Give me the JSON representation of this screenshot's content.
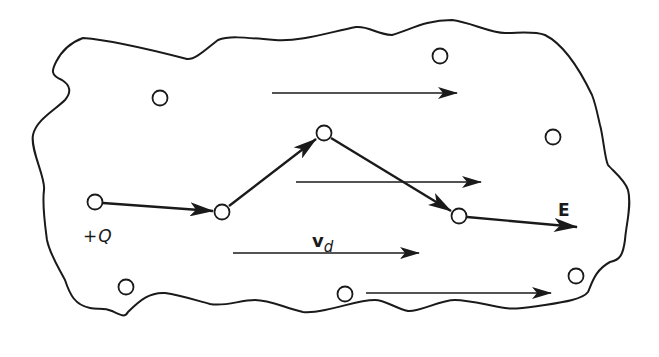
{
  "figure": {
    "colors": {
      "stroke": "#1a1a1a",
      "background": "#ffffff"
    }
  },
  "labels": {
    "charge_sign": "+",
    "charge_symbol": "Q",
    "drift_velocity_symbol": "v",
    "drift_velocity_subscript": "d",
    "field_symbol": "E"
  },
  "ions": [
    {
      "x": 160,
      "y": 98
    },
    {
      "x": 440,
      "y": 56
    },
    {
      "x": 553,
      "y": 137
    },
    {
      "x": 126,
      "y": 287
    },
    {
      "x": 345,
      "y": 294
    },
    {
      "x": 576,
      "y": 276
    }
  ],
  "path_nodes": [
    {
      "x": 95,
      "y": 202,
      "role": "start"
    },
    {
      "x": 222,
      "y": 212
    },
    {
      "x": 324,
      "y": 133
    },
    {
      "x": 459,
      "y": 216
    },
    {
      "x": 577,
      "y": 227,
      "role": "end"
    }
  ],
  "field_arrows": [
    {
      "x1": 272,
      "y1": 93,
      "x2": 457,
      "y2": 93
    },
    {
      "x1": 296,
      "y1": 182,
      "x2": 481,
      "y2": 182
    },
    {
      "x1": 233,
      "y1": 253,
      "x2": 419,
      "y2": 253
    },
    {
      "x1": 366,
      "y1": 293,
      "x2": 551,
      "y2": 293
    }
  ]
}
